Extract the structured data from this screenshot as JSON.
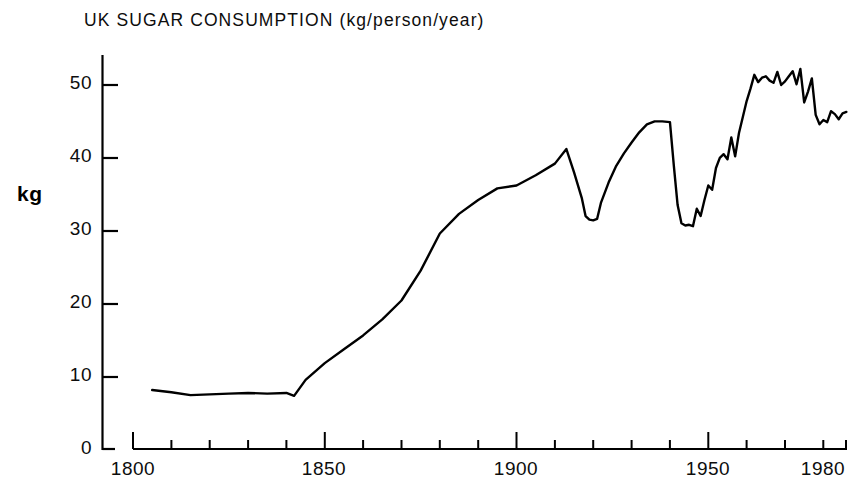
{
  "chart_data": {
    "type": "line",
    "title": "UK SUGAR CONSUMPTION  (kg/person/year)",
    "xlabel": "",
    "ylabel": "kg",
    "xlim": [
      1800,
      1986
    ],
    "ylim": [
      0,
      55
    ],
    "grid": false,
    "legend": null,
    "yticks": [
      0,
      10,
      20,
      30,
      40,
      50
    ],
    "ytick_labels": [
      "0",
      "10",
      "20",
      "30",
      "40",
      "50"
    ],
    "xticks": [
      1800,
      1850,
      1900,
      1950,
      1980
    ],
    "xtick_labels": [
      "1800",
      "1850",
      "1900",
      "1950",
      "1980"
    ],
    "x_minor_tick_interval": 10,
    "line_color": "#000000",
    "series": [
      {
        "name": "UK sugar consumption",
        "x": [
          1805,
          1810,
          1815,
          1820,
          1825,
          1830,
          1835,
          1840,
          1842,
          1845,
          1850,
          1855,
          1860,
          1865,
          1870,
          1875,
          1880,
          1885,
          1890,
          1895,
          1900,
          1905,
          1910,
          1913,
          1915,
          1917,
          1918,
          1919,
          1920,
          1921,
          1922,
          1924,
          1926,
          1928,
          1930,
          1932,
          1934,
          1936,
          1938,
          1940,
          1941,
          1942,
          1943,
          1944,
          1945,
          1946,
          1947,
          1948,
          1949,
          1950,
          1951,
          1952,
          1953,
          1954,
          1955,
          1956,
          1957,
          1958,
          1959,
          1960,
          1961,
          1962,
          1963,
          1964,
          1965,
          1966,
          1967,
          1968,
          1969,
          1970,
          1971,
          1972,
          1973,
          1974,
          1975,
          1976,
          1977,
          1978,
          1979,
          1980,
          1981,
          1982,
          1983,
          1984,
          1985,
          1986
        ],
        "y": [
          8.1,
          7.8,
          7.4,
          7.5,
          7.6,
          7.7,
          7.6,
          7.7,
          7.3,
          9.5,
          11.8,
          13.7,
          15.6,
          17.8,
          20.4,
          24.5,
          29.6,
          32.3,
          34.2,
          35.8,
          36.2,
          37.6,
          39.2,
          41.2,
          38.0,
          34.5,
          32.0,
          31.5,
          31.4,
          31.6,
          33.8,
          36.6,
          38.9,
          40.6,
          42.1,
          43.5,
          44.6,
          45.0,
          45.0,
          44.9,
          39.0,
          33.5,
          31.0,
          30.7,
          30.8,
          30.6,
          33.0,
          32.0,
          34.2,
          36.2,
          35.6,
          38.6,
          40.0,
          40.5,
          39.8,
          42.8,
          40.2,
          43.4,
          45.6,
          47.8,
          49.5,
          51.4,
          50.4,
          51.0,
          51.2,
          50.6,
          50.3,
          51.8,
          50.0,
          50.5,
          51.2,
          51.9,
          50.1,
          52.2,
          47.6,
          49.1,
          50.9,
          45.9,
          44.6,
          45.2,
          44.9,
          46.4,
          46.0,
          45.3,
          46.1,
          46.3
        ]
      }
    ]
  },
  "axis": {
    "y_axis_name": "y-axis-line",
    "x_axis_name": "x-axis-line"
  }
}
